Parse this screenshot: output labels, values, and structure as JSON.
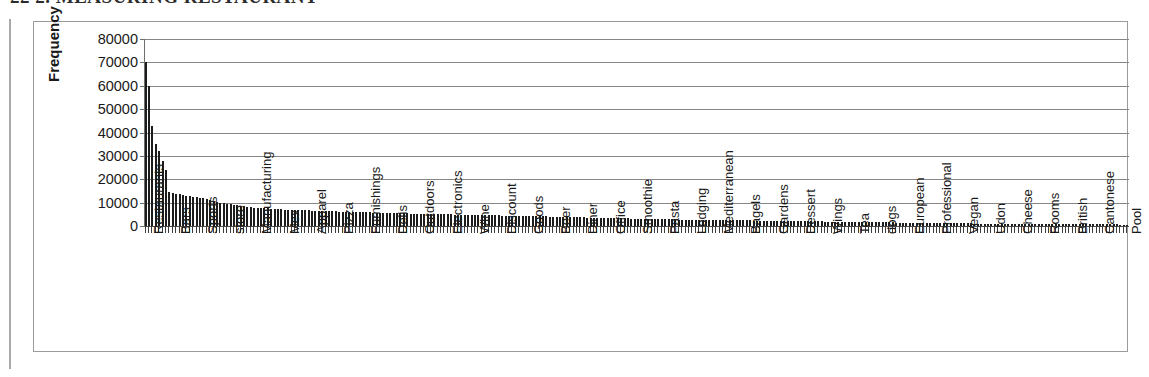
{
  "page": {
    "header_text": "22    2. MEASURING RESTAURANT",
    "left_rule": "page-margin-rule"
  },
  "figure": {
    "border_color": "#9b9b9b",
    "background": "#ffffff"
  },
  "chart_data": {
    "type": "bar",
    "title": "",
    "subtitle": "",
    "xlabel": "",
    "ylabel": "Frequency",
    "ylim": [
      0,
      80000
    ],
    "yticks": [
      0,
      10000,
      20000,
      30000,
      40000,
      50000,
      60000,
      70000,
      80000
    ],
    "ytick_labels": [
      "0",
      "10000",
      "20000",
      "30000",
      "40000",
      "50000",
      "60000",
      "70000",
      "80000"
    ],
    "grid": true,
    "grid_axis": "y",
    "legend": false,
    "legend_position": "none",
    "bar_color": "#1c1c1c",
    "n_bars": 290,
    "label_interval": 8,
    "labeled_categories": [
      "Restaurants",
      "Bars",
      "Sports",
      "store",
      "Manufacturing",
      "Mex",
      "Apparel",
      "Pizza",
      "Furnishings",
      "Delis",
      "Outdoors",
      "Electronics",
      "Wine",
      "Discount",
      "Goods",
      "Beer",
      "Diner",
      "Office",
      "Smoothie",
      "Pasta",
      "Lodging",
      "Mediterranean",
      "Bagels",
      "Gardens",
      "Dessert",
      "Wings",
      "Tea",
      "dogs",
      "European",
      "Professional",
      "Vegan",
      "Udon",
      "Cheese",
      "Rooms",
      "British",
      "Cantonese",
      "Pool",
      "Bowling",
      "Education",
      "Sum",
      "Fondue"
    ],
    "values": [
      70000,
      60000,
      43000,
      35000,
      32000,
      28000,
      24000,
      14500,
      14000,
      13800,
      13500,
      13200,
      13000,
      12800,
      12500,
      12200,
      12000,
      11800,
      11500,
      11000,
      10500,
      10200,
      10000,
      9800,
      9500,
      9300,
      9000,
      8800,
      8600,
      8400,
      8200,
      8000,
      7900,
      7800,
      7700,
      7600,
      7500,
      7400,
      7300,
      7200,
      7100,
      7000,
      6950,
      6900,
      6850,
      6800,
      6750,
      6700,
      6650,
      6600,
      6550,
      6500,
      6450,
      6400,
      6350,
      6300,
      6250,
      6200,
      6150,
      6100,
      6050,
      6000,
      5960,
      5920,
      5880,
      5840,
      5800,
      5760,
      5720,
      5680,
      5640,
      5600,
      5560,
      5520,
      5480,
      5440,
      5400,
      5360,
      5320,
      5280,
      5240,
      5200,
      5170,
      5140,
      5110,
      5080,
      5050,
      5020,
      4990,
      4960,
      4930,
      4900,
      4870,
      4840,
      4810,
      4780,
      4750,
      4720,
      4690,
      4660,
      4630,
      4600,
      4570,
      4540,
      4510,
      4480,
      4450,
      4420,
      4390,
      4360,
      4330,
      4300,
      4270,
      4240,
      4210,
      4180,
      4150,
      4120,
      4090,
      4060,
      4030,
      4000,
      3960,
      3920,
      3880,
      3840,
      3800,
      3760,
      3720,
      3680,
      3640,
      3600,
      3560,
      3520,
      3480,
      3440,
      3400,
      3370,
      3340,
      3310,
      3280,
      3250,
      3220,
      3190,
      3160,
      3130,
      3100,
      3070,
      3040,
      3010,
      2980,
      2950,
      2920,
      2890,
      2860,
      2830,
      2800,
      2780,
      2760,
      2740,
      2720,
      2700,
      2680,
      2660,
      2640,
      2620,
      2600,
      2580,
      2560,
      2540,
      2520,
      2500,
      2480,
      2460,
      2440,
      2420,
      2400,
      2380,
      2360,
      2340,
      2320,
      2300,
      2280,
      2260,
      2240,
      2220,
      2200,
      2180,
      2160,
      2140,
      2120,
      2100,
      2080,
      2060,
      2040,
      2020,
      2000,
      1980,
      1960,
      1940,
      1920,
      1900,
      1880,
      1860,
      1840,
      1820,
      1800,
      1780,
      1760,
      1740,
      1720,
      1700,
      1680,
      1660,
      1640,
      1620,
      1600,
      1580,
      1560,
      1540,
      1520,
      1500,
      1480,
      1460,
      1440,
      1420,
      1400,
      1380,
      1360,
      1340,
      1320,
      1300,
      1280,
      1260,
      1240,
      1220,
      1200,
      1180,
      1160,
      1140,
      1120,
      1100,
      1090,
      1080,
      1070,
      1060,
      1050,
      1040,
      1030,
      1020,
      1010,
      1000,
      990,
      980,
      970,
      960,
      950,
      940,
      930,
      920,
      910,
      900,
      890,
      880,
      870,
      860,
      850,
      840,
      830,
      820,
      810,
      800,
      790,
      780,
      770,
      760,
      750,
      740,
      730,
      720,
      710,
      700,
      690,
      680,
      670,
      660,
      650,
      640,
      630,
      620,
      610,
      600
    ]
  }
}
